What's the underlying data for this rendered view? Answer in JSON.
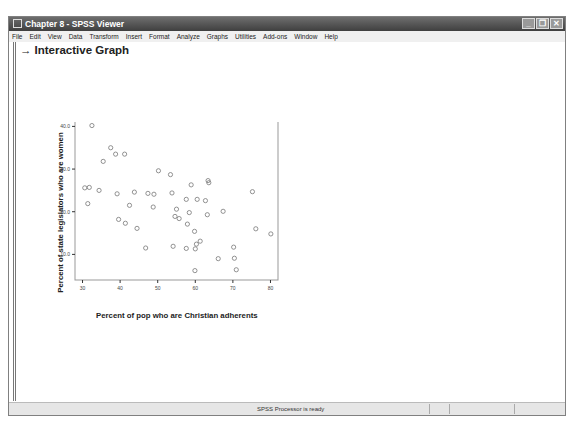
{
  "window": {
    "title": "Chapter 8 - SPSS Viewer",
    "controls": {
      "minimize": "_",
      "restore": "❐",
      "close": "✕"
    }
  },
  "menubar": [
    "File",
    "Edit",
    "View",
    "Data",
    "Transform",
    "Insert",
    "Format",
    "Analyze",
    "Graphs",
    "Utilities",
    "Add-ons",
    "Window",
    "Help"
  ],
  "output": {
    "heading": "Interactive Graph",
    "arrow_icon": "→"
  },
  "statusbar": {
    "message": "SPSS Processor  is ready"
  },
  "chart_data": {
    "type": "scatter",
    "title": "",
    "xlabel": "Percent of pop who are Christian adherents",
    "ylabel": "Percent of state legislators who are women",
    "xlim": [
      28,
      82
    ],
    "ylim": [
      4,
      41.5
    ],
    "xticks": [
      30,
      40,
      50,
      60,
      70,
      80
    ],
    "yticks": [
      "10.0",
      "20.0",
      "30.0",
      "40.0"
    ],
    "grid": false,
    "points": [
      [
        32.5,
        40.2
      ],
      [
        37.5,
        35.0
      ],
      [
        38.8,
        33.5
      ],
      [
        41.2,
        33.5
      ],
      [
        35.5,
        31.8
      ],
      [
        30.6,
        25.6
      ],
      [
        31.8,
        25.7
      ],
      [
        34.4,
        25.0
      ],
      [
        39.2,
        24.2
      ],
      [
        43.8,
        24.6
      ],
      [
        47.4,
        24.3
      ],
      [
        49.0,
        24.1
      ],
      [
        31.4,
        21.9
      ],
      [
        42.5,
        21.5
      ],
      [
        48.8,
        21.1
      ],
      [
        39.6,
        18.2
      ],
      [
        41.4,
        17.3
      ],
      [
        44.5,
        16.1
      ],
      [
        46.8,
        11.5
      ],
      [
        50.2,
        29.6
      ],
      [
        53.4,
        28.7
      ],
      [
        58.9,
        26.3
      ],
      [
        63.4,
        27.3
      ],
      [
        63.6,
        26.8
      ],
      [
        53.8,
        24.4
      ],
      [
        57.6,
        22.9
      ],
      [
        60.5,
        22.9
      ],
      [
        62.7,
        22.6
      ],
      [
        75.2,
        24.7
      ],
      [
        55.0,
        20.6
      ],
      [
        58.4,
        19.8
      ],
      [
        63.2,
        19.3
      ],
      [
        67.4,
        20.1
      ],
      [
        54.6,
        18.9
      ],
      [
        55.7,
        18.4
      ],
      [
        57.9,
        17.1
      ],
      [
        59.8,
        15.4
      ],
      [
        61.3,
        13.1
      ],
      [
        60.3,
        12.4
      ],
      [
        54.1,
        11.9
      ],
      [
        57.6,
        11.4
      ],
      [
        60.0,
        11.3
      ],
      [
        70.2,
        11.7
      ],
      [
        66.1,
        9.0
      ],
      [
        70.4,
        9.1
      ],
      [
        59.9,
        6.2
      ],
      [
        70.9,
        6.4
      ],
      [
        76.1,
        16.0
      ],
      [
        80.1,
        14.8
      ]
    ]
  }
}
